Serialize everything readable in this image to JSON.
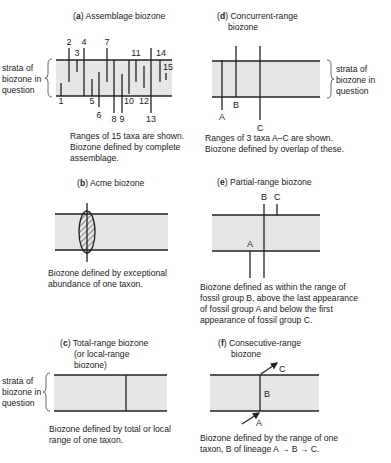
{
  "panels": {
    "a": {
      "letter": "a",
      "title": "Assemblage biozone",
      "side_label": [
        "strata of",
        "biozone in",
        "question"
      ],
      "taxa": [
        {
          "label": "1",
          "x": 61,
          "y1": 83,
          "y2": 96,
          "lx": 61,
          "ly": 104
        },
        {
          "label": "2",
          "x": 69,
          "y1": 48,
          "y2": 82,
          "lx": 69,
          "ly": 45
        },
        {
          "label": "3",
          "x": 77,
          "y1": 60,
          "y2": 72,
          "lx": 77,
          "ly": 56
        },
        {
          "label": "4",
          "x": 84,
          "y1": 48,
          "y2": 96,
          "lx": 84,
          "ly": 45
        },
        {
          "label": "5",
          "x": 92,
          "y1": 79,
          "y2": 96,
          "lx": 92,
          "ly": 104
        },
        {
          "label": "6",
          "x": 99,
          "y1": 72,
          "y2": 107,
          "lx": 99,
          "ly": 118
        },
        {
          "label": "7",
          "x": 107,
          "y1": 48,
          "y2": 82,
          "lx": 107,
          "ly": 45
        },
        {
          "label": "8",
          "x": 114,
          "y1": 60,
          "y2": 113,
          "lx": 114,
          "ly": 122
        },
        {
          "label": "9",
          "x": 122,
          "y1": 74,
          "y2": 113,
          "lx": 122,
          "ly": 122
        },
        {
          "label": "10",
          "x": 129,
          "y1": 60,
          "y2": 94,
          "lx": 129,
          "ly": 104
        },
        {
          "label": "11",
          "x": 136,
          "y1": 60,
          "y2": 82,
          "lx": 136,
          "ly": 56
        },
        {
          "label": "12",
          "x": 144,
          "y1": 66,
          "y2": 88,
          "lx": 144,
          "ly": 104
        },
        {
          "label": "13",
          "x": 151,
          "y1": 48,
          "y2": 113,
          "lx": 151,
          "ly": 122
        },
        {
          "label": "14",
          "x": 160,
          "y1": 60,
          "y2": 82,
          "lx": 161,
          "ly": 56
        },
        {
          "label": "15",
          "x": 166,
          "y1": 73,
          "y2": 80,
          "lx": 168,
          "ly": 70
        }
      ],
      "caption": [
        "Ranges of 15 taxa are shown.",
        "Biozone defined by complete",
        "assemblage."
      ]
    },
    "b": {
      "letter": "b",
      "title": "Acme biozone",
      "caption": [
        "Biozone defined by exceptional",
        "abundance of one taxon."
      ]
    },
    "c": {
      "letter": "c",
      "title": [
        "Total-range biozone",
        "(or local-range",
        "biozone)"
      ],
      "side_label": [
        "strata of",
        "biozone in",
        "question"
      ],
      "caption": [
        "Biozone defined by total or local",
        "range of one taxon."
      ]
    },
    "d": {
      "letter": "d",
      "title": [
        "Concurrent-range",
        "biozone"
      ],
      "side_label": [
        "strata of",
        "biozone in",
        "question"
      ],
      "taxa": [
        "A",
        "B",
        "C"
      ],
      "caption": [
        "Ranges of 3 taxa A–C are shown.",
        "Biozone defined by overlap of these."
      ]
    },
    "e": {
      "letter": "e",
      "title": "Partial-range biozone",
      "taxa": [
        "A",
        "B",
        "C"
      ],
      "caption": [
        "Biozone defined as within the range of",
        "fossil group B, above the last appearance",
        "of fossil group A and below the first",
        "appearance of fossil group C."
      ]
    },
    "f": {
      "letter": "f",
      "title": [
        "Consecutive-range",
        "biozone"
      ],
      "taxa": [
        "A",
        "B",
        "C"
      ],
      "caption": [
        "Biozone defined by the range of one",
        "taxon, B of lineage A → B → C."
      ]
    }
  },
  "colors": {
    "band": "#e6e6e6",
    "line": "#222222"
  }
}
